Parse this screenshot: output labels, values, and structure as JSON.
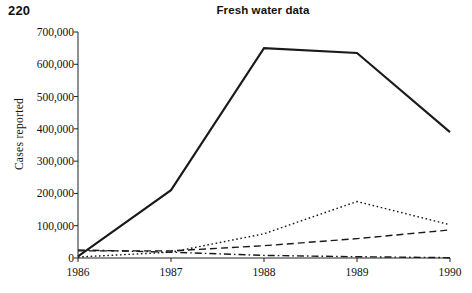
{
  "page": {
    "page_number": "220"
  },
  "chart_data": {
    "type": "line",
    "title": "Fresh water data",
    "xlabel": "",
    "ylabel": "Cases reported",
    "categories": [
      "1986",
      "1987",
      "1988",
      "1989",
      "1990"
    ],
    "x": [
      1986,
      1987,
      1988,
      1989,
      1990
    ],
    "xlim": [
      1986,
      1990
    ],
    "ylim": [
      0,
      700000
    ],
    "yticks": [
      0,
      100000,
      200000,
      300000,
      400000,
      500000,
      600000,
      700000
    ],
    "ytick_labels": [
      "0",
      "100,000",
      "200,000",
      "300,000",
      "400,000",
      "500,000",
      "600,000",
      "700,000"
    ],
    "grid": false,
    "legend": "none",
    "series": [
      {
        "name": "series-1",
        "style": "solid",
        "color": "#1a1a1a",
        "values": [
          5000,
          210000,
          650000,
          635000,
          390000
        ]
      },
      {
        "name": "series-2",
        "style": "dotted",
        "color": "#1a1a1a",
        "values": [
          3000,
          18000,
          75000,
          175000,
          103000
        ]
      },
      {
        "name": "series-3",
        "style": "dashed",
        "color": "#1a1a1a",
        "values": [
          22000,
          22000,
          38000,
          60000,
          87000
        ]
      },
      {
        "name": "series-4",
        "style": "dashdot",
        "color": "#1a1a1a",
        "values": [
          25000,
          18000,
          8000,
          4000,
          1000
        ]
      }
    ]
  }
}
